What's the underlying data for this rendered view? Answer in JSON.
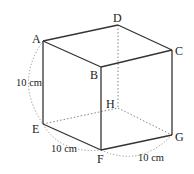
{
  "figure": {
    "type": "cube",
    "vertices": {
      "A": {
        "label": "A",
        "x": 43,
        "y": 41
      },
      "B": {
        "label": "B",
        "x": 101,
        "y": 67
      },
      "C": {
        "label": "C",
        "x": 172,
        "y": 50
      },
      "D": {
        "label": "D",
        "x": 118,
        "y": 25
      },
      "E": {
        "label": "E",
        "x": 43,
        "y": 124
      },
      "F": {
        "label": "F",
        "x": 101,
        "y": 150
      },
      "G": {
        "label": "G",
        "x": 172,
        "y": 135
      },
      "H": {
        "label": "H",
        "x": 118,
        "y": 108
      }
    },
    "dimensions": {
      "AE": "10 cm",
      "EF": "10 cm",
      "FG": "10 cm"
    },
    "visible_edges": [
      "AB",
      "BC",
      "CD",
      "DA",
      "AE",
      "BF",
      "CG",
      "EF",
      "FG"
    ],
    "hidden_edges": [
      "DH",
      "EH",
      "HG"
    ]
  }
}
